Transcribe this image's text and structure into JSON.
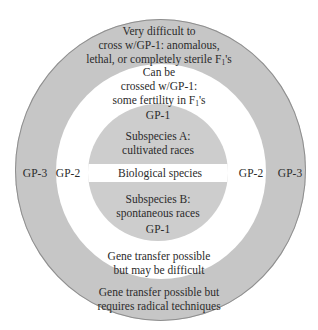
{
  "diagram": {
    "colors": {
      "outer_ring": "#c6c6c6",
      "middle_ring": "#ffffff",
      "core": "#cdcdcd",
      "text": "#2b2b2b",
      "outline": "#8e8e8e"
    },
    "gp3": {
      "label": "GP-3",
      "description_top": {
        "line1": "Very difficult to",
        "line2": "cross w/GP-1: anomalous,",
        "line3_pre": "lethal, or completely sterile F",
        "line3_sub": "1",
        "line3_post": "'s"
      },
      "description_bottom": {
        "line1": "Gene transfer possible but",
        "line2": "requires radical techniques"
      }
    },
    "gp2": {
      "label": "GP-2",
      "description_top": {
        "line1": "Can be",
        "line2": "crossed w/GP-1:",
        "line3_pre": "some fertility in F",
        "line3_sub": "1",
        "line3_post": "'s"
      },
      "description_bottom": {
        "line1": "Gene transfer possible",
        "line2": "but may be difficult"
      }
    },
    "gp1": {
      "label": "GP-1",
      "subspecies_a": {
        "line1": "Subspecies A:",
        "line2": "cultivated races"
      },
      "center_label": "Biological species",
      "subspecies_b": {
        "line1": "Subspecies B:",
        "line2": "spontaneous races"
      }
    }
  }
}
